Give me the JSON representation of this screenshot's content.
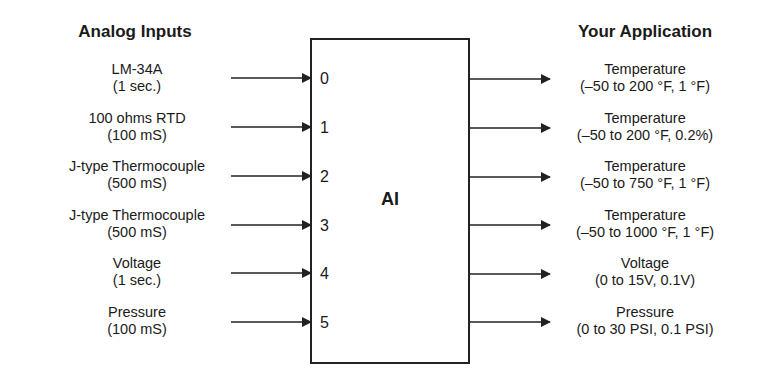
{
  "headings": {
    "inputs": "Analog Inputs",
    "outputs": "Your Application"
  },
  "block": {
    "title": "AI",
    "ports": [
      "0",
      "1",
      "2",
      "3",
      "4",
      "5"
    ]
  },
  "inputs": [
    {
      "name": "LM-34A",
      "detail": "(1 sec.)"
    },
    {
      "name": "100 ohms RTD",
      "detail": "(100 mS)"
    },
    {
      "name": "J-type Thermocouple",
      "detail": "(500 mS)"
    },
    {
      "name": "J-type Thermocouple",
      "detail": "(500 mS)"
    },
    {
      "name": "Voltage",
      "detail": "(1 sec.)"
    },
    {
      "name": "Pressure",
      "detail": "(100 mS)"
    }
  ],
  "outputs": [
    {
      "name": "Temperature",
      "detail": "(–50 to 200 °F, 1 °F)"
    },
    {
      "name": "Temperature",
      "detail": "(–50 to 200 °F, 0.2%)"
    },
    {
      "name": "Temperature",
      "detail": "(–50 to 750 °F, 1 °F)"
    },
    {
      "name": "Temperature",
      "detail": "(–50 to 1000 °F, 1 °F)"
    },
    {
      "name": "Voltage",
      "detail": "(0 to 15V, 0.1V)"
    },
    {
      "name": "Pressure",
      "detail": "(0 to 30 PSI, 0.1 PSI)"
    }
  ],
  "colors": {
    "line": "#222222",
    "text": "#1a1a1a",
    "background": "#ffffff"
  }
}
